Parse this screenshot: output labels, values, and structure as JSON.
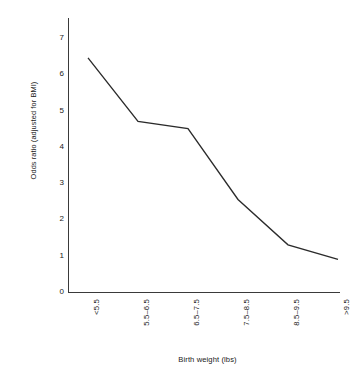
{
  "chart_data": {
    "type": "line",
    "title": "",
    "xlabel": "Birth weight (lbs)",
    "ylabel": "Odds ratio (adjusted for BMI)",
    "categories": [
      "<5.5",
      "5.5–6.5",
      "6.5–7.5",
      "7.5–8.5",
      "8.5–9.5",
      ">9.5"
    ],
    "values": [
      6.45,
      4.7,
      4.5,
      2.55,
      1.3,
      0.9
    ],
    "ylim": [
      0,
      7
    ],
    "yticks": [
      0,
      1,
      2,
      3,
      4,
      5,
      6,
      7
    ],
    "ytick_labels": [
      "0",
      "1",
      "2",
      "3",
      "4",
      "5",
      "6",
      "7"
    ],
    "grid": false,
    "legend": null,
    "series": [
      {
        "name": "Odds ratio (adjusted for BMI)",
        "values": [
          6.45,
          4.7,
          4.5,
          2.55,
          1.3,
          0.9
        ]
      }
    ],
    "line_color": "#2b2b2b"
  }
}
